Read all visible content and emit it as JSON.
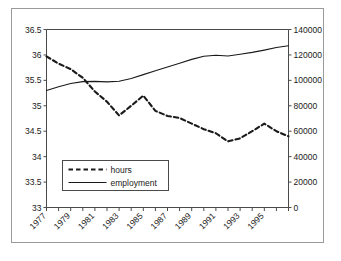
{
  "chart_data": {
    "type": "line",
    "title": "",
    "subtitle": "",
    "xlabel": "",
    "ylabel": "",
    "grid": false,
    "legend_position": "inside-bottom-left",
    "x": [
      1977,
      1978,
      1979,
      1980,
      1981,
      1982,
      1983,
      1984,
      1985,
      1986,
      1987,
      1988,
      1989,
      1990,
      1991,
      1992,
      1993,
      1994,
      1995,
      1996,
      1997
    ],
    "x_tick_labels": [
      "1977",
      "1979",
      "1981",
      "1983",
      "1985",
      "1987",
      "1989",
      "1991",
      "1993",
      "1995"
    ],
    "x_tick_values": [
      1977,
      1979,
      1981,
      1983,
      1985,
      1987,
      1989,
      1991,
      1993,
      1995
    ],
    "xlim": [
      1977,
      1997
    ],
    "axes": [
      {
        "id": "left",
        "name": "hours-axis",
        "side": "left",
        "ylim": [
          33,
          36.5
        ],
        "ticks": [
          33,
          33.5,
          34,
          34.5,
          35,
          35.5,
          36,
          36.5
        ],
        "tick_labels": [
          "33",
          "33.5",
          "34",
          "34.5",
          "35",
          "35.5",
          "36",
          "36.5"
        ]
      },
      {
        "id": "right",
        "name": "employment-axis",
        "side": "right",
        "ylim": [
          0,
          140000
        ],
        "ticks": [
          0,
          20000,
          40000,
          60000,
          80000,
          100000,
          120000,
          140000
        ],
        "tick_labels": [
          "0",
          "20000",
          "40000",
          "60000",
          "80000",
          "100000",
          "120000",
          "140000"
        ]
      }
    ],
    "series": [
      {
        "name": "hours",
        "axis": "left",
        "style": "dashed",
        "color": "#1a1a1a",
        "values": [
          35.97,
          35.83,
          35.72,
          35.55,
          35.28,
          35.08,
          34.81,
          35.0,
          35.2,
          34.9,
          34.8,
          34.76,
          34.65,
          34.54,
          34.46,
          34.3,
          34.36,
          34.5,
          34.65,
          34.5,
          34.4
        ]
      },
      {
        "name": "employment",
        "axis": "right",
        "style": "solid",
        "color": "#1a1a1a",
        "values": [
          92000,
          95000,
          97500,
          99000,
          99200,
          98800,
          99300,
          101500,
          104500,
          107500,
          110500,
          113500,
          116500,
          119000,
          119800,
          119200,
          120500,
          122000,
          123800,
          125800,
          127200
        ]
      }
    ]
  },
  "legend": {
    "items": [
      {
        "label": "hours",
        "style": "dashed"
      },
      {
        "label": "employment",
        "style": "solid"
      }
    ]
  }
}
